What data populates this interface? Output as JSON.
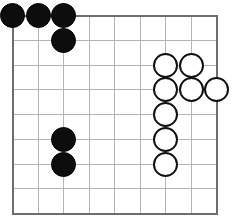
{
  "figure": {
    "width": 234,
    "height": 224
  },
  "board": {
    "type": "go-board",
    "columns": 9,
    "rows": 9,
    "origin_x": 12.5,
    "origin_y": 15.5,
    "step_x": 25.5,
    "step_y": 24.75,
    "grid_color": "#b4b4b4",
    "border_color": "#6e6e6e",
    "background_color": "#ffffff",
    "grid_line_width": 1,
    "border_line_width": 2,
    "stone_diameter": 25,
    "black_color": "#0d0d0d",
    "white_color": "#ffffff",
    "white_outline_color": "#111111"
  },
  "stones": [
    {
      "color": "black",
      "col": 0,
      "row": 0,
      "label": "black-stone-a9"
    },
    {
      "color": "black",
      "col": 1,
      "row": 0,
      "label": "black-stone-b9"
    },
    {
      "color": "black",
      "col": 2,
      "row": 0,
      "label": "black-stone-c9"
    },
    {
      "color": "black",
      "col": 2,
      "row": 1,
      "label": "black-stone-c8"
    },
    {
      "color": "black",
      "col": 2,
      "row": 5,
      "label": "black-stone-c4"
    },
    {
      "color": "black",
      "col": 2,
      "row": 6,
      "label": "black-stone-c3"
    },
    {
      "color": "white",
      "col": 6,
      "row": 2,
      "label": "white-stone-g7"
    },
    {
      "color": "white",
      "col": 7,
      "row": 2,
      "label": "white-stone-h7"
    },
    {
      "color": "white",
      "col": 6,
      "row": 3,
      "label": "white-stone-g6"
    },
    {
      "color": "white",
      "col": 7,
      "row": 3,
      "label": "white-stone-h6"
    },
    {
      "color": "white",
      "col": 8,
      "row": 3,
      "label": "white-stone-j6"
    },
    {
      "color": "white",
      "col": 6,
      "row": 4,
      "label": "white-stone-g5"
    },
    {
      "color": "white",
      "col": 6,
      "row": 5,
      "label": "white-stone-g4"
    },
    {
      "color": "white",
      "col": 6,
      "row": 6,
      "label": "white-stone-g3"
    }
  ],
  "counts": {
    "black_stones": 6,
    "white_stones": 8
  }
}
